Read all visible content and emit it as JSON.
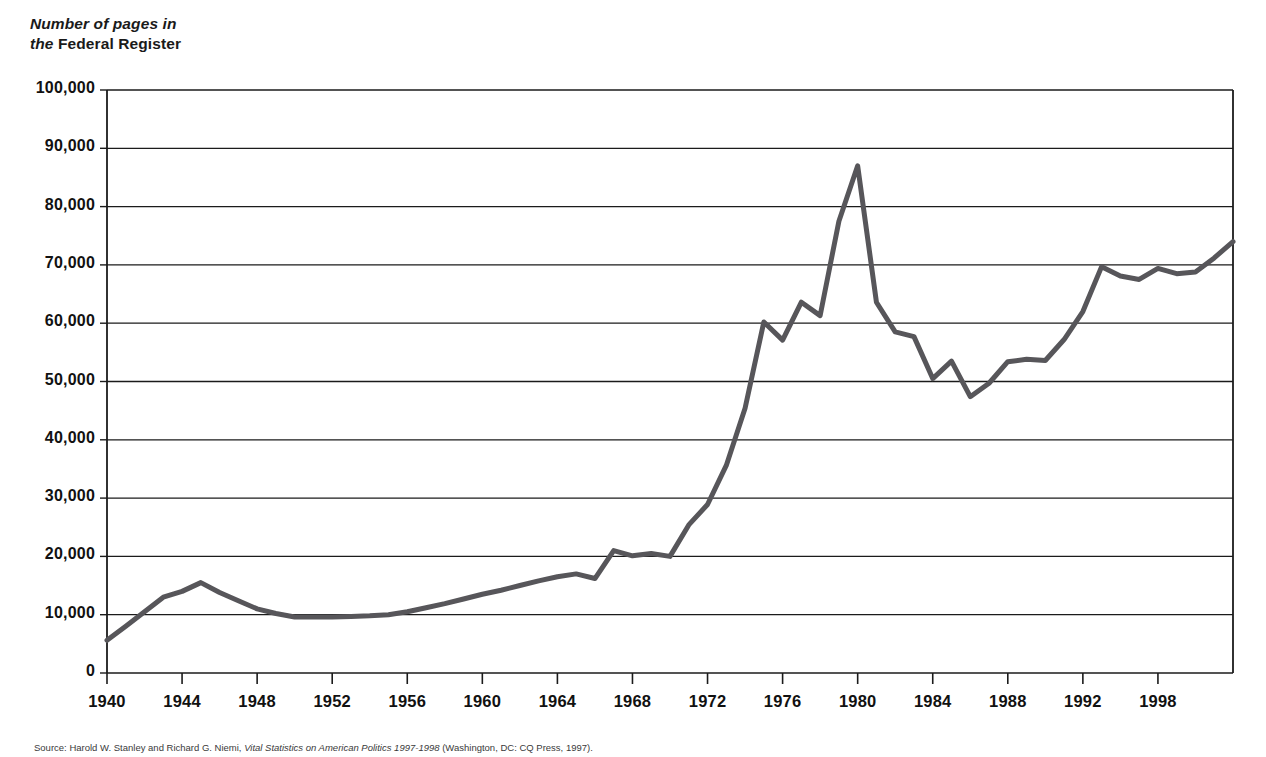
{
  "title": {
    "line1_italic": "Number of pages in",
    "line2_italic": "the ",
    "line2_upright": "Federal Register"
  },
  "source": {
    "label": "Source: ",
    "authors": "Harold W. Stanley and Richard G. Niemi, ",
    "work_italic": "Vital Statistics on American Politics 1997-1998 ",
    "publisher": "(Washington, DC: CQ Press, 1997)."
  },
  "axis": {
    "y_ticks": [
      "100,000",
      "90,000",
      "80,000",
      "70,000",
      "60,000",
      "50,000",
      "40,000",
      "30,000",
      "20,000",
      "10,000",
      "0"
    ],
    "x_ticks": [
      "1940",
      "1944",
      "1948",
      "1952",
      "1956",
      "1960",
      "1964",
      "1968",
      "1972",
      "1976",
      "1980",
      "1984",
      "1988",
      "1992",
      "1998"
    ]
  },
  "chart_data": {
    "type": "line",
    "title": "Number of pages in the Federal Register",
    "xlabel": "",
    "ylabel": "Number of pages in the Federal Register",
    "xlim": [
      1940,
      2000
    ],
    "ylim": [
      0,
      100000
    ],
    "grid": "horizontal",
    "legend": "none",
    "line_color": "#57565a",
    "line_width_px": 5,
    "x": [
      1940,
      1941,
      1942,
      1943,
      1944,
      1945,
      1946,
      1947,
      1948,
      1949,
      1950,
      1951,
      1952,
      1953,
      1954,
      1955,
      1956,
      1957,
      1958,
      1959,
      1960,
      1961,
      1962,
      1963,
      1964,
      1965,
      1966,
      1967,
      1968,
      1969,
      1970,
      1971,
      1972,
      1973,
      1974,
      1975,
      1976,
      1977,
      1978,
      1979,
      1980,
      1981,
      1982,
      1983,
      1984,
      1985,
      1986,
      1987,
      1988,
      1989,
      1990,
      1991,
      1992,
      1993,
      1994,
      1995,
      1996,
      1997,
      1998,
      1999,
      2000
    ],
    "values": [
      5600,
      8000,
      10500,
      13000,
      14000,
      15500,
      13800,
      12400,
      11000,
      10200,
      9600,
      9600,
      9600,
      9700,
      9800,
      10000,
      10500,
      11200,
      11900,
      12700,
      13500,
      14200,
      15000,
      15800,
      16500,
      17000,
      16200,
      21000,
      20100,
      20500,
      20000,
      25400,
      28900,
      35600,
      45400,
      60200,
      57100,
      63600,
      61300,
      77500,
      87000,
      63600,
      58500,
      57700,
      50500,
      53500,
      47400,
      49700,
      53400,
      53800,
      53600,
      57200,
      62000,
      69700,
      68100,
      67500,
      69400,
      68500,
      68800,
      71200,
      74000
    ],
    "y_gridlines": [
      0,
      10000,
      20000,
      30000,
      40000,
      50000,
      60000,
      70000,
      80000,
      90000,
      100000
    ]
  },
  "geometry": {
    "plot_left": 107,
    "plot_right": 1233,
    "plot_top": 90,
    "plot_bottom": 673
  }
}
